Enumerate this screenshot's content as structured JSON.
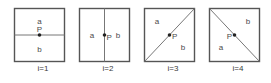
{
  "figure": {
    "background_color": "#ffffff",
    "border_color": "#555555",
    "line_color": "#777777",
    "point_color": "#222222",
    "text_color": "#4a4a4a",
    "point_label": "P",
    "region_label_a": "a",
    "region_label_b": "b"
  },
  "cases": [
    {
      "caption": "i=1",
      "divider": "horizontal",
      "label_top_or_left": "a",
      "label_bottom_or_right": "b",
      "point_label": "P",
      "point_label_position": "above"
    },
    {
      "caption": "i=2",
      "divider": "vertical",
      "label_top_or_left": "a",
      "label_bottom_or_right": "b",
      "point_label": "P",
      "point_label_position": "right"
    },
    {
      "caption": "i=3",
      "divider": "diagonal-bottomleft-topright",
      "label_top_or_left": "a",
      "label_bottom_or_right": "b",
      "point_label": "P",
      "point_label_position": "right"
    },
    {
      "caption": "i=4",
      "divider": "diagonal-topleft-bottomright",
      "label_top_or_left": "b",
      "label_bottom_or_right": "a",
      "point_label": "P",
      "point_label_position": "left"
    }
  ]
}
